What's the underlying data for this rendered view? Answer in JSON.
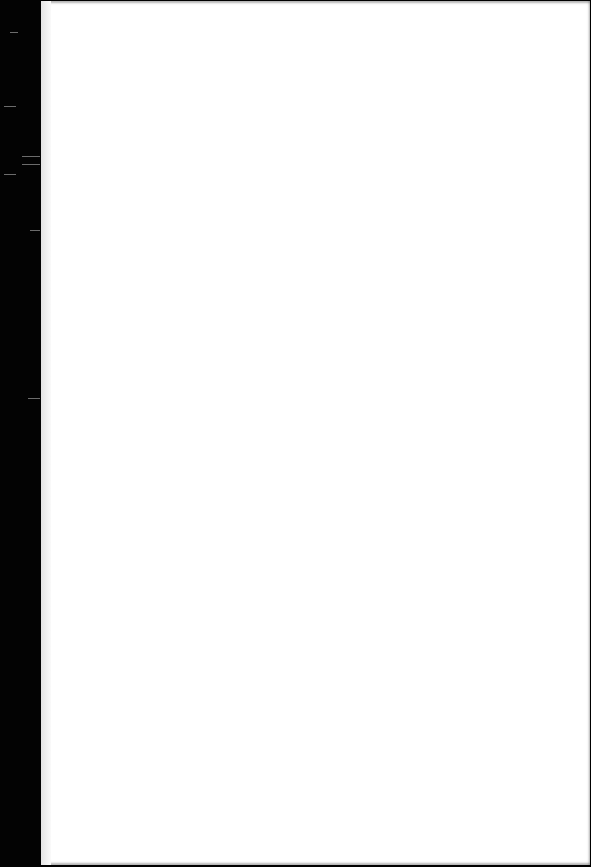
{
  "document": {
    "type": "scanned-page",
    "content": "",
    "background_color": "#ffffff",
    "border_color": "#000000"
  }
}
